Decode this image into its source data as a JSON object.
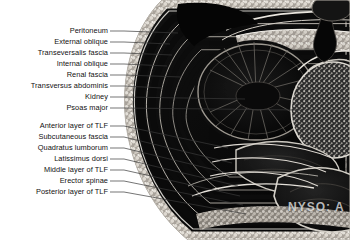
{
  "figure": {
    "kind": "anatomical-cross-section-photograph",
    "region": "axial section of posterior abdominal wall at the level of the kidney",
    "background_color": "#ffffff",
    "label_text_color": "#111111",
    "leader_line_color": "#3a3a3a"
  },
  "watermark": {
    "text": "NYSO: A"
  },
  "labels": {
    "top_group": [
      {
        "id": "peritoneum",
        "text": "Peritoneum",
        "text_right_x": 108,
        "text_y": 31,
        "leader_end_x": 178,
        "leader_end_y": 33
      },
      {
        "id": "external-oblique",
        "text": "External oblique",
        "text_right_x": 108,
        "text_y": 42,
        "leader_end_x": 170,
        "leader_end_y": 44
      },
      {
        "id": "transeversalis-fascia",
        "text": "Transeversalis fascia",
        "text_right_x": 108,
        "text_y": 53,
        "leader_end_x": 172,
        "leader_end_y": 55
      },
      {
        "id": "internal-oblique",
        "text": "Internal oblique",
        "text_right_x": 108,
        "text_y": 64,
        "leader_end_x": 167,
        "leader_end_y": 66
      },
      {
        "id": "renal-fascia",
        "text": "Renal fascia",
        "text_right_x": 108,
        "text_y": 75,
        "leader_end_x": 181,
        "leader_end_y": 77
      },
      {
        "id": "transversus-abdominis",
        "text": "Transversus abdominis",
        "text_right_x": 108,
        "text_y": 86,
        "leader_end_x": 163,
        "leader_end_y": 88
      },
      {
        "id": "kidney",
        "text": "Kidney",
        "text_right_x": 108,
        "text_y": 97,
        "leader_end_x": 245,
        "leader_end_y": 99
      },
      {
        "id": "psoas-major",
        "text": "Psoas major",
        "text_right_x": 108,
        "text_y": 108,
        "leader_end_x": 300,
        "leader_end_y": 110
      }
    ],
    "bottom_group": [
      {
        "id": "anterior-layer-of-tlf",
        "text": "Anterior layer of TLF",
        "text_right_x": 108,
        "text_y": 126,
        "leader_end_x": 228,
        "leader_end_y": 148
      },
      {
        "id": "subcutaneous-fascia",
        "text": "Subcutaneous fascia",
        "text_right_x": 108,
        "text_y": 137,
        "leader_end_x": 232,
        "leader_end_y": 163
      },
      {
        "id": "quadratus-lumborum",
        "text": "Quadratus lumborum",
        "text_right_x": 108,
        "text_y": 148,
        "leader_end_x": 236,
        "leader_end_y": 175
      },
      {
        "id": "latissimus-dorsi",
        "text": "Latissimus dorsi",
        "text_right_x": 108,
        "text_y": 159,
        "leader_end_x": 238,
        "leader_end_y": 186
      },
      {
        "id": "middle-layer-of-tlf",
        "text": "Middle layer of TLF",
        "text_right_x": 108,
        "text_y": 170,
        "leader_end_x": 240,
        "leader_end_y": 196
      },
      {
        "id": "erector-spinae",
        "text": "Erector spinae",
        "text_right_x": 108,
        "text_y": 181,
        "leader_end_x": 243,
        "leader_end_y": 205
      },
      {
        "id": "posterior-layer-of-tlf",
        "text": "Posterior layer of TLF",
        "text_right_x": 108,
        "text_y": 192,
        "leader_end_x": 246,
        "leader_end_y": 214
      }
    ]
  }
}
